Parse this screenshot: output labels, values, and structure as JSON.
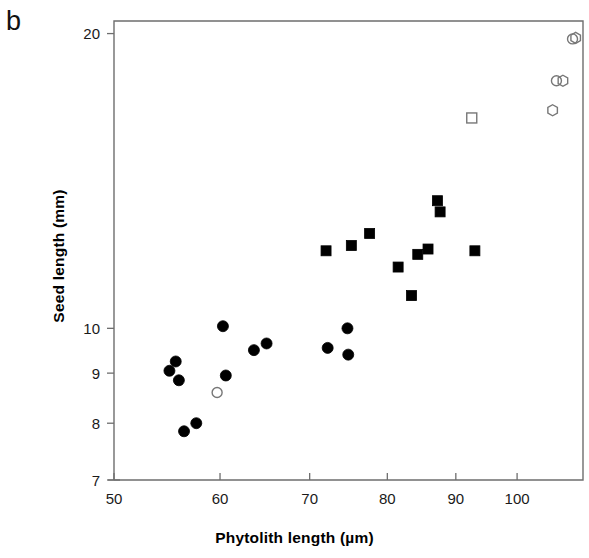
{
  "figure": {
    "panel_label": "b",
    "background_color": "#ffffff",
    "frame_color": "#6e6e6e"
  },
  "chart_data": {
    "type": "scatter",
    "title": "",
    "subtitle": "",
    "panel": "b",
    "xlabel": "Phytolith length  (µm)",
    "ylabel": "Seed length  (mm)",
    "xscale": "log",
    "yscale": "log",
    "xlim": [
      50,
      112
    ],
    "ylim": [
      7,
      20.6
    ],
    "xticks": [
      50,
      60,
      70,
      80,
      90,
      100
    ],
    "xtick_labels": [
      "50",
      "60",
      "70",
      "80",
      "90",
      "100"
    ],
    "yticks": [
      7,
      8,
      9,
      10,
      20
    ],
    "ytick_labels": [
      "7",
      "8",
      "9",
      "10",
      "20"
    ],
    "grid": false,
    "legend": "none",
    "series": [
      {
        "name": "filled-circle",
        "marker": "circle",
        "fill": "#000000",
        "stroke": "#000000",
        "size": 11,
        "points": [
          [
            55.0,
            9.05
          ],
          [
            55.6,
            9.25
          ],
          [
            55.9,
            8.85
          ],
          [
            56.4,
            7.85
          ],
          [
            57.6,
            8.0
          ],
          [
            60.3,
            10.05
          ],
          [
            60.6,
            8.95
          ],
          [
            63.6,
            9.5
          ],
          [
            65.0,
            9.65
          ],
          [
            72.2,
            9.55
          ],
          [
            74.7,
            10.0
          ],
          [
            74.8,
            9.4
          ]
        ]
      },
      {
        "name": "open-circle",
        "marker": "circle",
        "fill": "none",
        "stroke": "#777777",
        "size": 10,
        "points": [
          [
            59.7,
            8.6
          ],
          [
            107.0,
            17.9
          ],
          [
            110.0,
            19.75
          ]
        ]
      },
      {
        "name": "filled-square",
        "marker": "square",
        "fill": "#000000",
        "stroke": "#000000",
        "size": 10,
        "points": [
          [
            72.0,
            12.0
          ],
          [
            75.2,
            12.15
          ],
          [
            77.6,
            12.5
          ],
          [
            81.5,
            11.55
          ],
          [
            83.4,
            10.8
          ],
          [
            84.3,
            11.9
          ],
          [
            85.8,
            12.05
          ],
          [
            87.2,
            13.5
          ],
          [
            87.6,
            13.15
          ],
          [
            93.0,
            12.0
          ]
        ]
      },
      {
        "name": "open-square",
        "marker": "square",
        "fill": "none",
        "stroke": "#777777",
        "size": 10,
        "points": [
          [
            92.5,
            16.4
          ]
        ]
      },
      {
        "name": "open-hexagon",
        "marker": "hexagon",
        "fill": "none",
        "stroke": "#777777",
        "size": 11,
        "points": [
          [
            106.3,
            16.7
          ],
          [
            108.2,
            17.9
          ],
          [
            110.6,
            19.8
          ]
        ]
      }
    ]
  },
  "geometry": {
    "plot_left": 114,
    "plot_right": 583,
    "plot_top": 21,
    "plot_bottom": 480
  }
}
